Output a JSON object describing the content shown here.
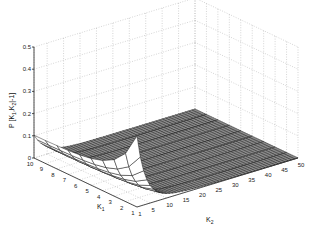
{
  "chart_data": {
    "type": "surface3d",
    "title": "",
    "xlabel": "K2",
    "ylabel": "K1",
    "zlabel": "P[K1,K2|-1]",
    "x_ticks": [
      "1",
      "5",
      "10",
      "15",
      "20",
      "25",
      "30",
      "35",
      "40",
      "45",
      "50"
    ],
    "y_ticks": [
      "1",
      "2",
      "3",
      "4",
      "5",
      "6",
      "7",
      "8",
      "9",
      "10"
    ],
    "z_ticks": [
      "0",
      "0.1",
      "0.2",
      "0.3",
      "0.4",
      "0.5"
    ],
    "zlim": [
      0,
      0.5
    ],
    "xlim": [
      1,
      50
    ],
    "ylim": [
      1,
      10
    ],
    "grid": true,
    "approx_points": [
      {
        "K1": 10,
        "K2": 1,
        "P": 0.1
      },
      {
        "K1": 5,
        "K2": 1,
        "P": 0.08
      },
      {
        "K1": 1,
        "K2": 1,
        "P": 0.28
      },
      {
        "K1": 1,
        "K2": 10,
        "P": 0.03
      },
      {
        "K1": 10,
        "K2": 50,
        "P": 0.0
      },
      {
        "K1": 1,
        "K2": 50,
        "P": 0.0
      }
    ]
  },
  "axes": {
    "z_label_text": "P [K",
    "z_label_sub1": "1",
    "z_label_mid": ",K",
    "z_label_sub2": "2",
    "z_label_end": "|-1]",
    "k1_label": "K",
    "k1_sub": "1",
    "k2_label": "K",
    "k2_sub": "2"
  }
}
